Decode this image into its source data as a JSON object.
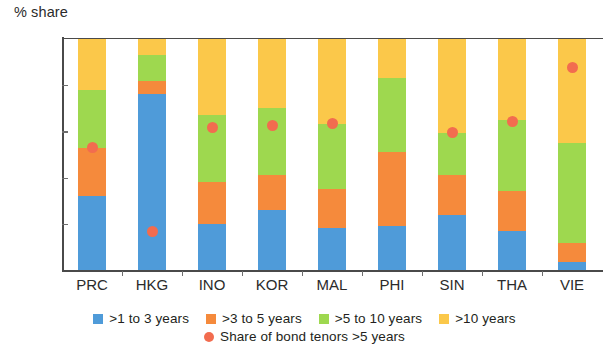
{
  "chart_data": {
    "type": "bar",
    "subtype": "stacked-bar-with-scatter-overlay",
    "title": "",
    "ylabel": "% share",
    "xlabel": "",
    "ylim": [
      0,
      100
    ],
    "yticks": [
      0,
      20,
      40,
      60,
      80,
      100
    ],
    "ytick_labels": [
      "0",
      "20",
      "40",
      "60",
      "80",
      "100"
    ],
    "grid": false,
    "legend_position": "bottom",
    "stacked": true,
    "categories": [
      "PRC",
      "HKG",
      "INO",
      "KOR",
      "MAL",
      "PHI",
      "SIN",
      "THA",
      "VIE"
    ],
    "series": [
      {
        "name": ">1 to 3 years",
        "color": "#4f9bd9",
        "values": [
          32,
          76,
          20,
          26,
          18,
          19,
          24,
          17,
          3.5
        ]
      },
      {
        "name": ">3 to 5 years",
        "color": "#f58a3c",
        "values": [
          21,
          6,
          18,
          15,
          17,
          32,
          17,
          17,
          8
        ]
      },
      {
        "name": ">5 to 10 years",
        "color": "#9ed84f",
        "values": [
          25,
          11,
          29,
          29,
          28,
          32,
          18.5,
          31,
          43.5
        ]
      },
      {
        "name": ">10 years",
        "color": "#fbc84a",
        "values": [
          22,
          7,
          33,
          30,
          37,
          17,
          40.5,
          35,
          45
        ]
      }
    ],
    "overlay": {
      "name": "Share of bond tenors >5 years",
      "color": "#f26c4f",
      "marker": "circle",
      "values": [
        53,
        16.5,
        61.5,
        62.5,
        63.5,
        null,
        59.5,
        64.5,
        87.5
      ]
    },
    "legend_entries": [
      {
        "label": ">1 to 3 years",
        "color": "#4f9bd9",
        "marker": "square"
      },
      {
        "label": ">3 to 5 years",
        "color": "#f58a3c",
        "marker": "square"
      },
      {
        "label": ">5 to 10 years",
        "color": "#9ed84f",
        "marker": "square"
      },
      {
        "label": ">10 years",
        "color": "#fbc84a",
        "marker": "square"
      },
      {
        "label": "Share of bond tenors >5 years",
        "color": "#f26c4f",
        "marker": "circle"
      }
    ]
  }
}
